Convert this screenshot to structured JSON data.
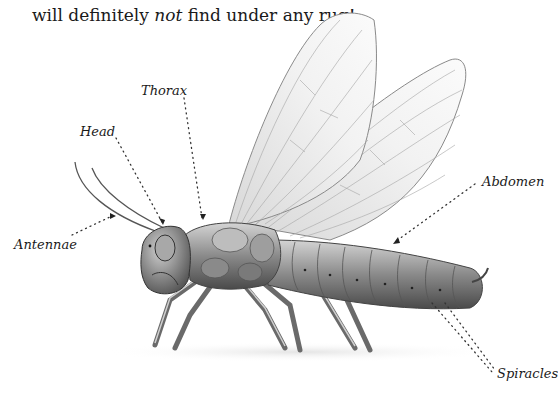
{
  "caption": {
    "before": "will definitely ",
    "emphasis": "not",
    "after": " find under any rug!"
  },
  "labels": {
    "thorax": "Thorax",
    "head": "Head",
    "antennae": "Antennae",
    "abdomen": "Abdomen",
    "spiracles": "Spiracles"
  },
  "colors": {
    "text": "#1a1a1a",
    "body_dark": "#5a5a5a",
    "body_mid": "#8c8c8c",
    "body_light": "#c8c8c8",
    "wing_vein": "#9a9a9a"
  }
}
